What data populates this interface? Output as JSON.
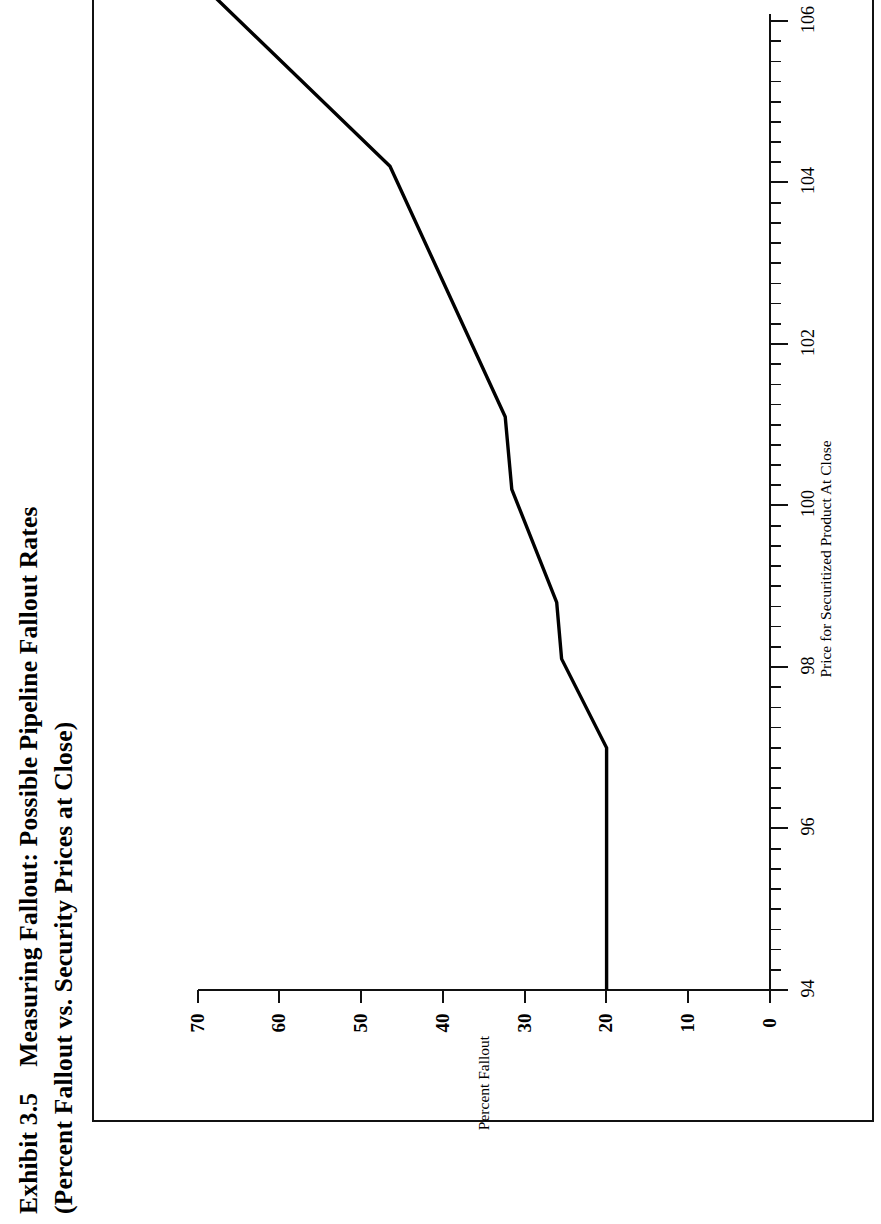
{
  "exhibit": {
    "number": "Exhibit 3.5",
    "title_line1": "Measuring Fallout:  Possible Pipeline Fallout Rates",
    "title_line2": "(Percent Fallout vs.  Security Prices at Close)"
  },
  "chart_data": {
    "type": "line",
    "title": "Measuring Fallout: Possible Pipeline Fallout Rates (Percent Fallout vs. Security Prices at Close)",
    "xlabel": "Price for Securitized Product At Close",
    "ylabel": "Percent Fallout",
    "xlim": [
      94,
      106.4
    ],
    "ylim": [
      0,
      73
    ],
    "xticks": [
      94,
      96,
      98,
      100,
      102,
      104,
      106
    ],
    "xtick_labels": [
      "94",
      "96",
      "98",
      "100",
      "102",
      "104",
      "106"
    ],
    "yticks": [
      0,
      10,
      20,
      30,
      40,
      50,
      60,
      70
    ],
    "ytick_labels": [
      "0",
      "10",
      "20",
      "30",
      "40",
      "50",
      "60",
      "70"
    ],
    "x_minor_tick_interval": 0.25,
    "grid": false,
    "legend": null,
    "line_color": "#000000",
    "line_width": 3,
    "series": [
      {
        "name": "Percent Fallout",
        "x": [
          94.0,
          97.0,
          98.1,
          98.8,
          100.2,
          101.1,
          104.2,
          106.4
        ],
        "y": [
          20.0,
          20.0,
          25.5,
          26.1,
          31.6,
          32.4,
          46.5,
          69.0
        ]
      }
    ]
  },
  "axes": {
    "y_ticks_px": [
      {
        "label": "70",
        "pos": 198
      },
      {
        "label": "60",
        "pos": 279
      },
      {
        "label": "50",
        "pos": 361
      },
      {
        "label": "40",
        "pos": 443
      },
      {
        "label": "30",
        "pos": 525
      },
      {
        "label": "20",
        "pos": 606
      },
      {
        "label": "10",
        "pos": 688
      },
      {
        "label": "0",
        "pos": 770
      }
    ],
    "x_ticks_px": [
      {
        "label": "94",
        "pos": 990
      },
      {
        "label": "96",
        "pos": 828
      },
      {
        "label": "98",
        "pos": 667
      },
      {
        "label": "100",
        "pos": 505
      },
      {
        "label": "102",
        "pos": 344
      },
      {
        "label": "104",
        "pos": 182
      },
      {
        "label": "106",
        "pos": 21
      }
    ]
  }
}
